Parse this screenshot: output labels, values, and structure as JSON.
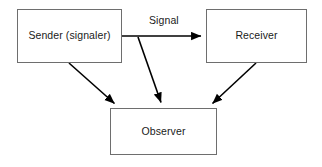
{
  "diagram": {
    "background_color": "#ffffff",
    "box_border_color": "#6e6e6e",
    "arrow_color": "#000000",
    "text_color": "#1a1a1a",
    "nodes": [
      {
        "id": "sender",
        "label": "Sender (signaler)",
        "x": 17,
        "y": 9,
        "width": 105,
        "height": 54
      },
      {
        "id": "receiver",
        "label": "Receiver",
        "x": 206,
        "y": 9,
        "width": 101,
        "height": 54
      },
      {
        "id": "observer",
        "label": "Observer",
        "x": 110,
        "y": 108,
        "width": 107,
        "height": 47
      }
    ],
    "edges": [
      {
        "id": "sender-to-receiver",
        "from": "sender",
        "to": "receiver",
        "label": "Signal",
        "label_x": 149,
        "label_y": 14,
        "x1": 122,
        "y1": 36,
        "x2": 206,
        "y2": 36
      },
      {
        "id": "sender-to-observer",
        "from": "sender",
        "to": "observer",
        "label": "",
        "x1": 69,
        "y1": 63,
        "x2": 118,
        "y2": 107
      },
      {
        "id": "signal-to-observer",
        "from": "sender-to-receiver",
        "to": "observer",
        "label": "",
        "x1": 138,
        "y1": 37,
        "x2": 163,
        "y2": 107
      },
      {
        "id": "receiver-to-observer",
        "from": "receiver",
        "to": "observer",
        "label": "",
        "x1": 256,
        "y1": 63,
        "x2": 209,
        "y2": 107
      }
    ]
  }
}
